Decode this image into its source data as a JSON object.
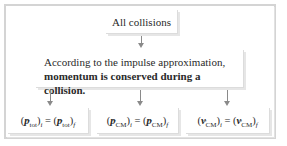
{
  "diagram": {
    "top_box": {
      "label": "All collisions"
    },
    "middle_box": {
      "line1": "According to the impulse approximation,",
      "line2": "momentum is conserved during a collision."
    },
    "equations": [
      {
        "symbol": "p",
        "subscript": "tot",
        "initial_label": "i",
        "final_label": "f",
        "text": "(p⃗tot)i = (p⃗tot)f"
      },
      {
        "symbol": "p",
        "subscript": "CM",
        "initial_label": "i",
        "final_label": "f",
        "text": "(p⃗CM)i = (p⃗CM)f"
      },
      {
        "symbol": "v",
        "subscript": "CM",
        "initial_label": "i",
        "final_label": "f",
        "text": "(v⃗CM)i = (v⃗CM)f"
      }
    ],
    "equals_sign": "=",
    "open_paren": "(",
    "close_paren": ")",
    "colors": {
      "frame": "#d4d4d4",
      "arrow": "#8a8a8a",
      "text": "#2a2a2a",
      "background": "#ffffff"
    }
  }
}
